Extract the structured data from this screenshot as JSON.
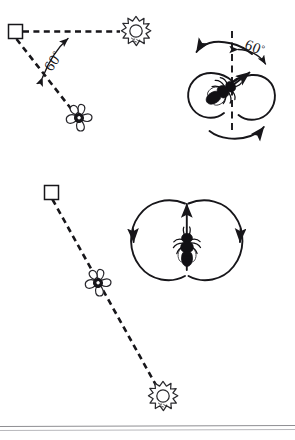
{
  "figure": {
    "background_color": "#ffffff",
    "ink_color": "#17161a",
    "width": 295,
    "height": 440,
    "panels": [
      {
        "id": "top-field",
        "role": "field-map",
        "position": "top-left",
        "caption": "",
        "symbols": [
          {
            "name": "hive",
            "glyph": "square",
            "x": 15,
            "y": 31,
            "label": ""
          },
          {
            "name": "sun",
            "glyph": "sun",
            "x": 136,
            "y": 31,
            "label": ""
          },
          {
            "name": "flower",
            "glyph": "flower",
            "x": 79,
            "y": 118,
            "label": ""
          }
        ],
        "lines": [
          {
            "name": "hive-to-sun",
            "from": "hive",
            "to": "sun",
            "style": "dashed"
          },
          {
            "name": "hive-to-flower",
            "from": "hive",
            "to": "flower",
            "style": "dashed"
          }
        ],
        "angle_label": "60",
        "angle_unit": "°",
        "angle_value": 60,
        "angle_between": "sun direction and food source direction"
      },
      {
        "id": "top-dance",
        "role": "dance-pattern",
        "position": "top-right",
        "caption": "",
        "angle_label": "60",
        "angle_unit": "°",
        "angle_value": 60,
        "angle_between": "vertical comb axis and waggle run",
        "axis": "vertical dashed line",
        "waggle_direction_deg_from_vertical": 60,
        "pattern": "figure-eight"
      },
      {
        "id": "bottom-field",
        "role": "field-map",
        "position": "bottom-left",
        "caption": "",
        "symbols": [
          {
            "name": "hive",
            "glyph": "square",
            "x": 51,
            "y": 192,
            "label": ""
          },
          {
            "name": "flower",
            "glyph": "flower",
            "x": 98,
            "y": 283,
            "label": ""
          },
          {
            "name": "sun",
            "glyph": "sun",
            "x": 163,
            "y": 396,
            "label": ""
          }
        ],
        "lines": [
          {
            "name": "hive-to-sun-through-flower",
            "from": "hive",
            "to": "sun",
            "style": "dashed"
          }
        ],
        "angle_label": "",
        "angle_value": 0,
        "angle_between": "sun direction and food source direction"
      },
      {
        "id": "bottom-dance",
        "role": "dance-pattern",
        "position": "bottom-right",
        "caption": "",
        "angle_label": "",
        "angle_value": 0,
        "angle_between": "vertical comb axis and waggle run",
        "axis": "vertical",
        "waggle_direction_deg_from_vertical": 0,
        "pattern": "figure-eight"
      }
    ],
    "icons": {
      "hive_icon_name": "square-hive-icon",
      "sun_icon_name": "sun-icon",
      "flower_icon_name": "flower-icon",
      "bee_icon_name": "bee-icon",
      "arrow_icon_name": "arrow-icon"
    },
    "footer_rule": {
      "name": "page-edge-rule",
      "color": "#8e8e92"
    }
  }
}
